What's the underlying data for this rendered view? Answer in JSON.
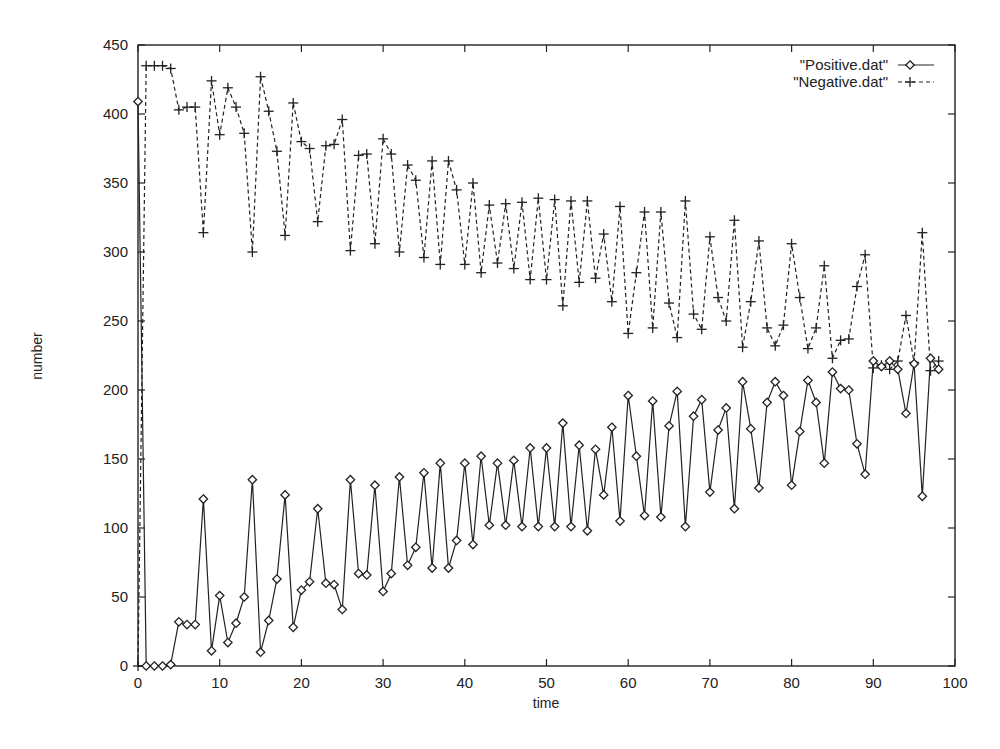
{
  "chart_data": {
    "type": "line",
    "title": "",
    "xlabel": "time",
    "ylabel": "number",
    "xlim": [
      0,
      100
    ],
    "ylim": [
      0,
      450
    ],
    "xticks": [
      0,
      10,
      20,
      30,
      40,
      50,
      60,
      70,
      80,
      90,
      100
    ],
    "yticks": [
      0,
      50,
      100,
      150,
      200,
      250,
      300,
      350,
      400,
      450
    ],
    "grid": false,
    "legend_position": "top-right",
    "x": [
      0,
      1,
      2,
      3,
      4,
      5,
      6,
      7,
      8,
      9,
      10,
      11,
      12,
      13,
      14,
      15,
      16,
      17,
      18,
      19,
      20,
      21,
      22,
      23,
      24,
      25,
      26,
      27,
      28,
      29,
      30,
      31,
      32,
      33,
      34,
      35,
      36,
      37,
      38,
      39,
      40,
      41,
      42,
      43,
      44,
      45,
      46,
      47,
      48,
      49,
      50,
      51,
      52,
      53,
      54,
      55,
      56,
      57,
      58,
      59,
      60,
      61,
      62,
      63,
      64,
      65,
      66,
      67,
      68,
      69,
      70,
      71,
      72,
      73,
      74,
      75,
      76,
      77,
      78,
      79,
      80,
      81,
      82,
      83,
      84,
      85,
      86,
      87,
      88,
      89,
      90,
      91,
      92,
      93,
      94,
      95,
      96,
      97,
      98
    ],
    "series": [
      {
        "name": "\"Positive.dat\"",
        "marker": "diamond",
        "line": "solid",
        "color": "#222222",
        "values": [
          409,
          0,
          0,
          0,
          1,
          32,
          30,
          30,
          121,
          11,
          51,
          17,
          31,
          50,
          135,
          10,
          33,
          63,
          124,
          28,
          55,
          61,
          114,
          60,
          59,
          41,
          135,
          67,
          66,
          131,
          54,
          67,
          137,
          73,
          86,
          140,
          71,
          147,
          71,
          91,
          147,
          88,
          152,
          102,
          147,
          102,
          149,
          101,
          158,
          101,
          158,
          101,
          176,
          101,
          160,
          98,
          157,
          124,
          173,
          105,
          196,
          152,
          109,
          192,
          108,
          174,
          199,
          101,
          181,
          193,
          126,
          171,
          187,
          114,
          206,
          172,
          129,
          191,
          206,
          196,
          131,
          170,
          207,
          191,
          147,
          213,
          201,
          200,
          161,
          139,
          221,
          217,
          221,
          215,
          183,
          219,
          123,
          223,
          215
        ]
      },
      {
        "name": "\"Negative.dat\"",
        "marker": "plus",
        "line": "dashed",
        "color": "#222222",
        "values": [
          0,
          435,
          435,
          435,
          433,
          403,
          405,
          405,
          314,
          424,
          385,
          419,
          405,
          386,
          300,
          427,
          402,
          373,
          312,
          408,
          380,
          375,
          322,
          377,
          378,
          396,
          301,
          370,
          371,
          306,
          382,
          371,
          300,
          363,
          352,
          296,
          366,
          291,
          366,
          345,
          291,
          350,
          285,
          334,
          292,
          335,
          288,
          336,
          280,
          339,
          280,
          338,
          261,
          337,
          278,
          337,
          281,
          313,
          264,
          333,
          241,
          285,
          329,
          245,
          329,
          263,
          238,
          337,
          255,
          244,
          311,
          267,
          250,
          323,
          231,
          264,
          308,
          245,
          232,
          247,
          306,
          267,
          230,
          245,
          290,
          223,
          236,
          237,
          275,
          298,
          216,
          218,
          215,
          221,
          254,
          220,
          314,
          214,
          221
        ]
      }
    ]
  },
  "legend": {
    "items": [
      {
        "label": "\"Positive.dat\""
      },
      {
        "label": "\"Negative.dat\""
      }
    ]
  },
  "axes": {
    "x_title": "time",
    "y_title": "number"
  }
}
